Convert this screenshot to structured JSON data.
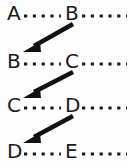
{
  "diagram": {
    "type": "chain-linking-diagram",
    "background_color": "#fdfdfd",
    "ink_color": "#1a1a1a",
    "canvas": {
      "width": 131,
      "height": 167
    },
    "rows": [
      {
        "id": "row-1",
        "y": 20,
        "left_label": "A",
        "right_label": "B",
        "left_label_x": 7,
        "right_label_x": 65,
        "dots_before_count": 6,
        "dots_after_count": 6
      },
      {
        "id": "row-2",
        "y": 68,
        "left_label": "B",
        "right_label": "C",
        "left_label_x": 7,
        "right_label_x": 65,
        "dots_before_count": 6,
        "dots_after_count": 6
      },
      {
        "id": "row-3",
        "y": 112,
        "left_label": "C",
        "right_label": "D",
        "left_label_x": 7,
        "right_label_x": 65,
        "dots_before_count": 6,
        "dots_after_count": 6
      },
      {
        "id": "row-4",
        "y": 158,
        "left_label": "D",
        "right_label": "E",
        "left_label_x": 7,
        "right_label_x": 65,
        "dots_before_count": 6,
        "dots_after_count": 6
      }
    ],
    "arrows": [
      {
        "id": "arrow-b-to-b",
        "from_label": "B",
        "to_label": "B",
        "from_row": "row-1",
        "to_row": "row-2",
        "x1": 73,
        "y1": 24,
        "x2": 26,
        "y2": 51
      },
      {
        "id": "arrow-c-to-c",
        "from_label": "C",
        "to_label": "C",
        "from_row": "row-2",
        "to_row": "row-3",
        "x1": 73,
        "y1": 72,
        "x2": 26,
        "y2": 97
      },
      {
        "id": "arrow-d-to-d",
        "from_label": "D",
        "to_label": "D",
        "from_row": "row-3",
        "to_row": "row-4",
        "x1": 73,
        "y1": 116,
        "x2": 26,
        "y2": 142
      }
    ]
  }
}
